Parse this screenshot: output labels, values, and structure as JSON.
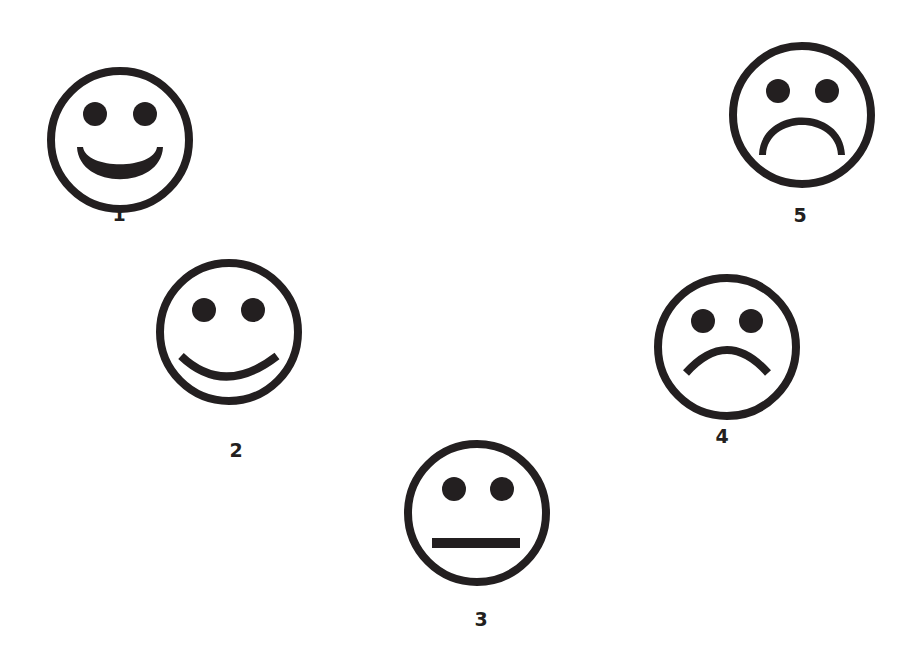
{
  "ink_color": "#231f20",
  "background_color": "#ffffff",
  "faces": [
    {
      "label": "1",
      "expression": "big-smile",
      "icon": "very-happy-face-icon"
    },
    {
      "label": "2",
      "expression": "smile",
      "icon": "happy-face-icon"
    },
    {
      "label": "3",
      "expression": "neutral",
      "icon": "neutral-face-icon"
    },
    {
      "label": "4",
      "expression": "frown",
      "icon": "sad-face-icon"
    },
    {
      "label": "5",
      "expression": "deep-frown",
      "icon": "very-sad-face-icon"
    }
  ]
}
